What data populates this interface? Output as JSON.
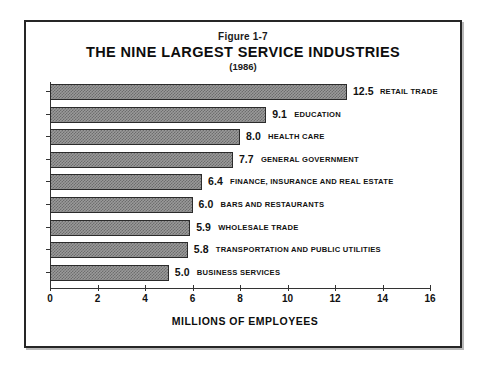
{
  "figure": {
    "number": "Figure 1-7",
    "title": "THE NINE LARGEST SERVICE INDUSTRIES",
    "subtitle": "(1986)"
  },
  "chart_data": {
    "type": "bar",
    "orientation": "horizontal",
    "title": "THE NINE LARGEST SERVICE INDUSTRIES",
    "subtitle": "(1986)",
    "figure_number": "Figure 1-7",
    "xlabel": "MILLIONS OF EMPLOYEES",
    "ylabel": "",
    "xlim": [
      0,
      16
    ],
    "xticks": [
      0,
      2,
      4,
      6,
      8,
      10,
      12,
      14,
      16
    ],
    "xtick_labels": [
      "0",
      "2",
      "4",
      "6",
      "8",
      "10",
      "12",
      "14",
      "16"
    ],
    "grid": false,
    "legend": "none",
    "bar_fill": "#9a9a9a",
    "bar_pattern": "checkerboard-dither",
    "bar_border": "#2b2b2b",
    "categories": [
      "RETAIL TRADE",
      "EDUCATION",
      "HEALTH CARE",
      "GENERAL GOVERNMENT",
      "FINANCE, INSURANCE AND REAL ESTATE",
      "BARS AND RESTAURANTS",
      "WHOLESALE TRADE",
      "TRANSPORTATION AND PUBLIC UTILITIES",
      "BUSINESS SERVICES"
    ],
    "values": [
      12.5,
      9.1,
      8.0,
      7.7,
      6.4,
      6.0,
      5.9,
      5.8,
      5.0
    ],
    "value_labels": [
      "12.5",
      "9.1",
      "8.0",
      "7.7",
      "6.4",
      "6.0",
      "5.9",
      "5.8",
      "5.0"
    ]
  }
}
